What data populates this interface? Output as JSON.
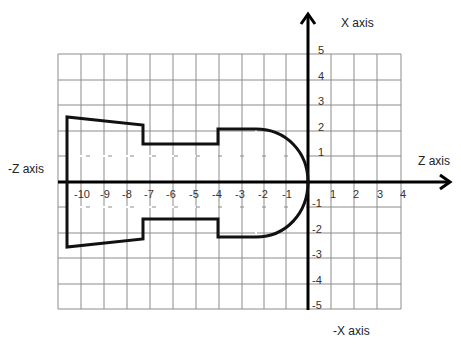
{
  "labels": {
    "x_axis": "X axis",
    "neg_x_axis": "-X axis",
    "z_axis": "Z axis",
    "neg_z_axis": "-Z axis"
  },
  "z_ticks": [
    {
      "label": "-10",
      "x": 82
    },
    {
      "label": "-9",
      "x": 105
    },
    {
      "label": "-8",
      "x": 127
    },
    {
      "label": "-7",
      "x": 149
    },
    {
      "label": "-6",
      "x": 171
    },
    {
      "label": "-5",
      "x": 194
    },
    {
      "label": "-4",
      "x": 217
    },
    {
      "label": "-3",
      "x": 240
    },
    {
      "label": "-2",
      "x": 263
    },
    {
      "label": "-1",
      "x": 287
    },
    {
      "label": "1",
      "x": 333
    },
    {
      "label": "2",
      "x": 356
    },
    {
      "label": "3",
      "x": 380
    },
    {
      "label": "4",
      "x": 403
    }
  ],
  "x_ticks": [
    {
      "label": "5",
      "y": 54
    },
    {
      "label": "4",
      "y": 80
    },
    {
      "label": "3",
      "y": 105
    },
    {
      "label": "2",
      "y": 131
    },
    {
      "label": "1",
      "y": 156
    },
    {
      "label": "-1",
      "y": 207
    },
    {
      "label": "-2",
      "y": 233
    },
    {
      "label": "-3",
      "y": 258
    },
    {
      "label": "-4",
      "y": 284
    },
    {
      "label": "-5",
      "y": 309
    }
  ],
  "grid": {
    "left": 58,
    "top": 54,
    "right": 401,
    "bottom": 309,
    "vlines": [
      58,
      81,
      104,
      127,
      150,
      173,
      196,
      219,
      242,
      264,
      286,
      331,
      354,
      377,
      401
    ],
    "hlines": [
      54,
      80,
      105,
      131,
      156,
      207,
      233,
      258,
      284,
      309
    ],
    "color": "#8c8c8c"
  },
  "axes": {
    "origin_x": 308,
    "origin_y": 182,
    "color": "#000000"
  },
  "profile": {
    "stroke": "#111111",
    "description": "Turned part profile symmetric about Z axis: stepped cylinder with taper, ending in radius R2 at Z0",
    "points_upper": [
      [
        -10.6,
        2.6
      ],
      [
        -7.2,
        2.2
      ],
      [
        -7.2,
        1.5
      ],
      [
        -4.0,
        1.5
      ],
      [
        -4.0,
        2.0
      ],
      [
        -2.2,
        2.0
      ],
      [
        0,
        0
      ]
    ],
    "points_lower": [
      [
        -10.6,
        -2.6
      ],
      [
        -7.2,
        -2.2
      ],
      [
        -7.2,
        -1.5
      ],
      [
        -4.0,
        -1.5
      ],
      [
        -4.0,
        -2.0
      ],
      [
        -2.2,
        -2.0
      ],
      [
        0,
        0
      ]
    ]
  }
}
